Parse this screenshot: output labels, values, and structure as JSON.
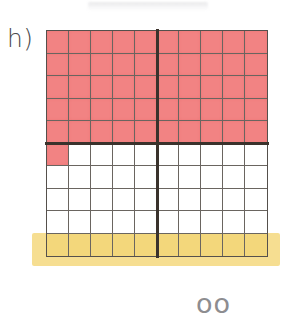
{
  "label": {
    "text": "h)"
  },
  "bottom_partial_text": "oo",
  "colors": {
    "shaded": "#f28383",
    "highlight": "#f3d77b",
    "highlighter_stroke": "#f6dd8c",
    "grid_line": "#6a6560",
    "grid_border": "#55504c",
    "divider": "#3a322c",
    "label_text": "#4a4a4c"
  },
  "chart_data": {
    "type": "heatmap",
    "title": "h)",
    "xlabel": "",
    "ylabel": "",
    "rows": 10,
    "columns": 10,
    "total_cells": 100,
    "shaded_cells": 51,
    "unshaded_cells": 49,
    "fraction_shaded": "51/100",
    "percent_shaded": 51,
    "legend": [
      {
        "name": "shaded",
        "color": "#f28383",
        "count": 51
      },
      {
        "name": "unshaded",
        "color": "#ffffff",
        "count": 49
      },
      {
        "name": "highlighted-row",
        "color": "#f3d77b",
        "count": 10
      }
    ],
    "grid": [
      [
        "red",
        "red",
        "red",
        "red",
        "red",
        "red",
        "red",
        "red",
        "red",
        "red"
      ],
      [
        "red",
        "red",
        "red",
        "red",
        "red",
        "red",
        "red",
        "red",
        "red",
        "red"
      ],
      [
        "red",
        "red",
        "red",
        "red",
        "red",
        "red",
        "red",
        "red",
        "red",
        "red"
      ],
      [
        "red",
        "red",
        "red",
        "red",
        "red",
        "red",
        "red",
        "red",
        "red",
        "red"
      ],
      [
        "red",
        "red",
        "red",
        "red",
        "red",
        "red",
        "red",
        "red",
        "red",
        "red"
      ],
      [
        "red",
        "none",
        "none",
        "none",
        "none",
        "none",
        "none",
        "none",
        "none",
        "none"
      ],
      [
        "none",
        "none",
        "none",
        "none",
        "none",
        "none",
        "none",
        "none",
        "none",
        "none"
      ],
      [
        "none",
        "none",
        "none",
        "none",
        "none",
        "none",
        "none",
        "none",
        "none",
        "none"
      ],
      [
        "none",
        "none",
        "none",
        "none",
        "none",
        "none",
        "none",
        "none",
        "none",
        "none"
      ],
      [
        "yellow",
        "yellow",
        "yellow",
        "yellow",
        "yellow",
        "yellow",
        "yellow",
        "yellow",
        "yellow",
        "yellow"
      ]
    ],
    "dividers": {
      "vertical_after_column": 5,
      "horizontal_after_row": 5
    },
    "grid_on": true,
    "legend_position": "none"
  }
}
